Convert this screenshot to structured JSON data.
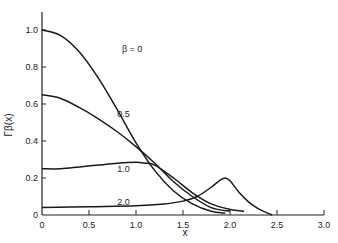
{
  "chart_data": {
    "type": "line",
    "title": "",
    "xlabel": "x",
    "ylabel": "Γβ(x)",
    "xlim": [
      0,
      3.0
    ],
    "ylim": [
      0,
      1.1
    ],
    "grid": false,
    "legend": "inline labels on curves",
    "x_ticks": [
      "0",
      "0.5",
      "1.0",
      "1.5",
      "2.0",
      "2.5",
      "3.0"
    ],
    "y_ticks": [
      "0",
      "0.2",
      "0.4",
      "0.6",
      "0.8",
      "1.0"
    ],
    "series": [
      {
        "name": "β = 0",
        "label_pos": [
          0.85,
          0.88
        ],
        "x": [
          0,
          0.2,
          0.4,
          0.6,
          0.8,
          1.0,
          1.2,
          1.4,
          1.6,
          1.8,
          1.95
        ],
        "y": [
          1.0,
          0.97,
          0.88,
          0.74,
          0.57,
          0.39,
          0.24,
          0.13,
          0.06,
          0.02,
          0.01
        ]
      },
      {
        "name": "0.5",
        "label_pos": [
          0.8,
          0.53
        ],
        "x": [
          0,
          0.2,
          0.4,
          0.6,
          0.8,
          1.0,
          1.2,
          1.4,
          1.6,
          1.8,
          2.0
        ],
        "y": [
          0.65,
          0.63,
          0.58,
          0.52,
          0.45,
          0.37,
          0.28,
          0.18,
          0.1,
          0.04,
          0.02
        ]
      },
      {
        "name": "1.0",
        "label_pos": [
          0.8,
          0.23
        ],
        "x": [
          0,
          0.2,
          0.4,
          0.6,
          0.8,
          1.0,
          1.1,
          1.2,
          1.4,
          1.6,
          1.8,
          2.0,
          2.15
        ],
        "y": [
          0.25,
          0.25,
          0.26,
          0.27,
          0.28,
          0.285,
          0.28,
          0.27,
          0.2,
          0.12,
          0.06,
          0.03,
          0.02
        ]
      },
      {
        "name": "2.0",
        "label_pos": [
          0.8,
          0.055
        ],
        "x": [
          0,
          0.5,
          1.0,
          1.3,
          1.5,
          1.65,
          1.8,
          1.9,
          1.95,
          2.0,
          2.1,
          2.2,
          2.3,
          2.4,
          2.45
        ],
        "y": [
          0.04,
          0.045,
          0.05,
          0.06,
          0.075,
          0.1,
          0.15,
          0.19,
          0.2,
          0.185,
          0.12,
          0.07,
          0.035,
          0.01,
          0.0
        ]
      }
    ]
  }
}
